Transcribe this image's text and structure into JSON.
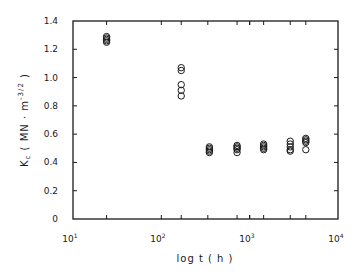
{
  "chart_data": {
    "type": "scatter",
    "title": "",
    "xlabel": "log t ( h )",
    "ylabel": "K_c ( MN·m^-3/2 )",
    "xscale": "log",
    "xlim": [
      10,
      10000
    ],
    "ylim": [
      0,
      1.4
    ],
    "x_tick_labels": [
      "10^1",
      "10^2",
      "10^3",
      "10^4"
    ],
    "y_tick_labels": [
      "0",
      "0.2",
      "0.4",
      "0.6",
      "0.8",
      "1.0",
      "1.2",
      "1.4"
    ],
    "y_ticks": [
      0,
      0.2,
      0.4,
      0.6,
      0.8,
      1.0,
      1.2,
      1.4
    ],
    "x_minor_ticks": [
      24,
      168,
      336,
      720,
      1000,
      1440,
      2880,
      4320
    ],
    "grid": false,
    "legend": null,
    "marker": "open-circle",
    "series": [
      {
        "name": "K_c",
        "points": [
          {
            "x": 24,
            "y": 1.29
          },
          {
            "x": 24,
            "y": 1.28
          },
          {
            "x": 24,
            "y": 1.27
          },
          {
            "x": 24,
            "y": 1.26
          },
          {
            "x": 24,
            "y": 1.25
          },
          {
            "x": 168,
            "y": 1.07
          },
          {
            "x": 168,
            "y": 1.05
          },
          {
            "x": 168,
            "y": 0.95
          },
          {
            "x": 168,
            "y": 0.91
          },
          {
            "x": 168,
            "y": 0.87
          },
          {
            "x": 350,
            "y": 0.51
          },
          {
            "x": 350,
            "y": 0.5
          },
          {
            "x": 350,
            "y": 0.49
          },
          {
            "x": 350,
            "y": 0.48
          },
          {
            "x": 350,
            "y": 0.47
          },
          {
            "x": 720,
            "y": 0.52
          },
          {
            "x": 720,
            "y": 0.51
          },
          {
            "x": 720,
            "y": 0.5
          },
          {
            "x": 720,
            "y": 0.49
          },
          {
            "x": 720,
            "y": 0.47
          },
          {
            "x": 1440,
            "y": 0.53
          },
          {
            "x": 1440,
            "y": 0.52
          },
          {
            "x": 1440,
            "y": 0.51
          },
          {
            "x": 1440,
            "y": 0.5
          },
          {
            "x": 1440,
            "y": 0.49
          },
          {
            "x": 2880,
            "y": 0.55
          },
          {
            "x": 2880,
            "y": 0.53
          },
          {
            "x": 2880,
            "y": 0.51
          },
          {
            "x": 2880,
            "y": 0.49
          },
          {
            "x": 2880,
            "y": 0.48
          },
          {
            "x": 4320,
            "y": 0.57
          },
          {
            "x": 4320,
            "y": 0.56
          },
          {
            "x": 4320,
            "y": 0.55
          },
          {
            "x": 4320,
            "y": 0.54
          },
          {
            "x": 4320,
            "y": 0.49
          }
        ]
      }
    ]
  },
  "labels": {
    "xlabel": "log t ( h )",
    "ylabel_main": "K",
    "ylabel_sub": "c",
    "ylabel_units": " ( MN · m",
    "ylabel_exp": "-3/2",
    "ylabel_close": " )",
    "x_ticks": {
      "t1": "10",
      "e1": "1",
      "t2": "10",
      "e2": "2",
      "t3": "10",
      "e3": "3",
      "t4": "10",
      "e4": "4"
    },
    "y_ticks": [
      "0",
      "0.2",
      "0.4",
      "0.6",
      "0.8",
      "1.0",
      "1.2",
      "1.4"
    ]
  },
  "colors": {
    "ink": "#1a1a1a",
    "background": "#ffffff"
  }
}
